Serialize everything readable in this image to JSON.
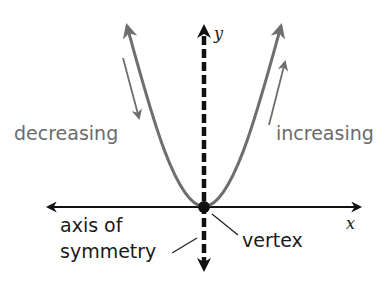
{
  "diagram": {
    "type": "parabola-graph",
    "labels": {
      "decreasing": "decreasing",
      "increasing": "increasing",
      "axis_of_symmetry_line1": "axis of",
      "axis_of_symmetry_line2": "symmetry",
      "vertex": "vertex",
      "x_axis": "x",
      "y_axis": "y"
    },
    "colors": {
      "curve": "#6e6e6e",
      "axes": "#111111",
      "gray_text": "#6b6b6b",
      "black_text": "#1a1a1a"
    }
  }
}
